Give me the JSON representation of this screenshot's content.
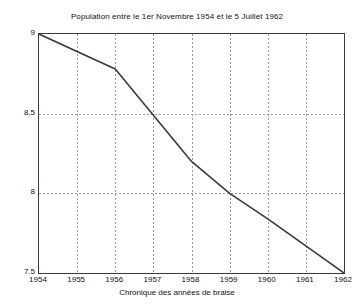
{
  "chart_data": {
    "type": "line",
    "title": "Population entre le 1er Novembre 1954 et le 5 Juillet 1962",
    "xlabel": "Chronique des années de braise",
    "ylabel": "",
    "x": [
      1954,
      1956,
      1958,
      1959,
      1960,
      1962
    ],
    "values": [
      9.0,
      8.78,
      8.2,
      8.0,
      7.84,
      7.5
    ],
    "series": [
      {
        "name": "Population",
        "points": [
          {
            "x": 1954,
            "y": 9.0
          },
          {
            "x": 1956,
            "y": 8.78
          },
          {
            "x": 1958,
            "y": 8.2
          },
          {
            "x": 1959,
            "y": 8.0
          },
          {
            "x": 1960,
            "y": 7.84
          },
          {
            "x": 1962,
            "y": 7.5
          }
        ]
      }
    ],
    "xlim": [
      1954,
      1962
    ],
    "ylim": [
      7.5,
      9.0
    ],
    "xticks": [
      1954,
      1955,
      1956,
      1957,
      1958,
      1959,
      1960,
      1961,
      1962
    ],
    "xticklabels": [
      "1954",
      "1955",
      "1956",
      "1957",
      "1958",
      "1959",
      "1960",
      "1961",
      "1962"
    ],
    "yticks": [
      7.5,
      8.0,
      8.5,
      9.0
    ],
    "yticklabels": [
      "7.5",
      "8",
      "8.5",
      "9"
    ],
    "grid": true,
    "grid_style": "dashed",
    "legend": null,
    "colors": {
      "line": "#3a3a3a",
      "grid": "#9a9a9a",
      "axis": "#3a3a3a",
      "background": "#ffffff",
      "text": "#111111"
    }
  }
}
